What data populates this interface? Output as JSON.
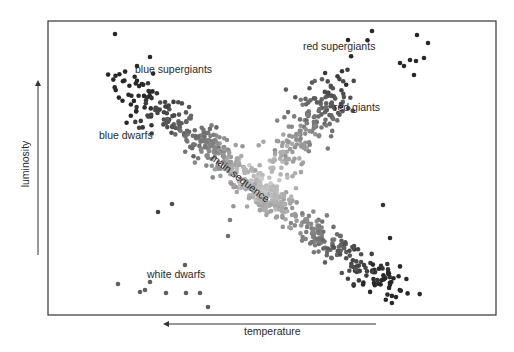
{
  "chart_data": {
    "type": "scatter",
    "xlabel": "temperature",
    "ylabel": "luminosity",
    "x_direction": "decreasing to the right (arrow points left)",
    "y_direction": "increasing upward",
    "grid": false,
    "legend": "none",
    "ticks": "none",
    "annotations": [
      {
        "text": "blue supergiants",
        "x": 135,
        "y": 70
      },
      {
        "text": "red supergiants",
        "x": 303,
        "y": 46
      },
      {
        "text": "red giants",
        "x": 334,
        "y": 108
      },
      {
        "text": "blue dwarfs",
        "x": 99,
        "y": 136
      },
      {
        "text": "main sequence",
        "x": 243,
        "y": 178,
        "rotate": 38
      },
      {
        "text": "white dwarfs",
        "x": 147,
        "y": 275
      }
    ],
    "clusters": [
      {
        "name": "blue supergiants",
        "cx": 150,
        "cy": 105,
        "sx": 26,
        "sy": 18,
        "n": 90,
        "tone": 70
      },
      {
        "name": "main sequence upper",
        "cx": 215,
        "cy": 150,
        "sx": 22,
        "sy": 14,
        "n": 160,
        "tone": 120
      },
      {
        "name": "main sequence",
        "cx": 260,
        "cy": 190,
        "sx": 20,
        "sy": 12,
        "n": 220,
        "tone": 175
      },
      {
        "name": "main sequence lower",
        "cx": 320,
        "cy": 235,
        "sx": 24,
        "sy": 14,
        "n": 120,
        "tone": 110
      },
      {
        "name": "red dwarfs",
        "cx": 375,
        "cy": 275,
        "sx": 18,
        "sy": 16,
        "n": 70,
        "tone": 60
      },
      {
        "name": "red giants",
        "cx": 320,
        "cy": 110,
        "sx": 18,
        "sy": 22,
        "n": 110,
        "tone": 115
      },
      {
        "name": "giant branch",
        "cx": 290,
        "cy": 150,
        "sx": 16,
        "sy": 22,
        "n": 90,
        "tone": 170
      }
    ],
    "outliers": [
      [
        115,
        34
      ],
      [
        150,
        57
      ],
      [
        137,
        66
      ],
      [
        372,
        31
      ],
      [
        417,
        35
      ],
      [
        428,
        43
      ],
      [
        400,
        63
      ],
      [
        404,
        66
      ],
      [
        410,
        60
      ],
      [
        416,
        61
      ],
      [
        414,
        75
      ],
      [
        424,
        58
      ],
      [
        348,
        40
      ],
      [
        118,
        284
      ],
      [
        145,
        290
      ],
      [
        150,
        282
      ],
      [
        140,
        292
      ],
      [
        166,
        293
      ],
      [
        186,
        293
      ],
      [
        200,
        293
      ],
      [
        208,
        307
      ],
      [
        185,
        265
      ],
      [
        158,
        212
      ],
      [
        172,
        204
      ],
      [
        228,
        236
      ],
      [
        230,
        220
      ],
      [
        255,
        184
      ],
      [
        383,
        205
      ],
      [
        390,
        238
      ]
    ],
    "frame": {
      "x0": 48,
      "y0": 21,
      "x1": 496,
      "y1": 315
    },
    "y_arrow": {
      "x": 38,
      "y_from": 255,
      "y_to": 80
    },
    "x_arrow": {
      "y": 324,
      "x_from": 376,
      "x_to": 163
    }
  }
}
